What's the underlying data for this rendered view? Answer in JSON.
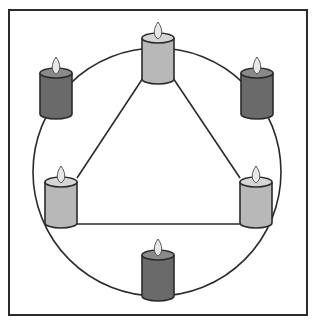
{
  "diagram": {
    "colors": {
      "frame": "#2b2b2b",
      "background": "#ffffff",
      "light_candle": "#b8b8b8",
      "light_candle_top": "#d6d6d6",
      "dark_candle": "#6a6a6a",
      "dark_candle_top": "#8a8a8a",
      "flame": "#e8e8e8",
      "line": "#2b2b2b"
    },
    "circle": {
      "cx": 157,
      "cy": 172,
      "r": 124
    },
    "candles": [
      {
        "id": "top",
        "shade": "light",
        "x": 142,
        "y": 33
      },
      {
        "id": "top-left",
        "shade": "dark",
        "x": 40,
        "y": 68
      },
      {
        "id": "top-right",
        "shade": "dark",
        "x": 241,
        "y": 68
      },
      {
        "id": "left",
        "shade": "light",
        "x": 45,
        "y": 177
      },
      {
        "id": "right",
        "shade": "light",
        "x": 240,
        "y": 177
      },
      {
        "id": "bottom",
        "shade": "dark",
        "x": 142,
        "y": 250
      }
    ],
    "triangle": {
      "connects": [
        "top",
        "left",
        "right"
      ]
    }
  }
}
